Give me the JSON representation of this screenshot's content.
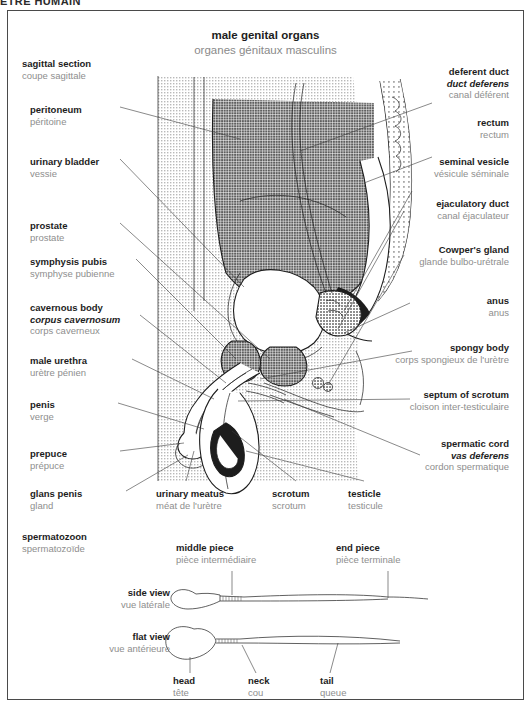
{
  "page_header": "ÊTRE HUMAIN",
  "plate": {
    "title_en": "male genital organs",
    "title_fr": "organes génitaux masculins"
  },
  "sections": [
    {
      "name": "sagittal-section",
      "en": "sagittal section",
      "fr": "coupe sagittale"
    },
    {
      "name": "spermatozoon",
      "en": "spermatozoon",
      "fr": "spermatozoïde"
    }
  ],
  "labels_left": [
    {
      "en": "peritoneum",
      "fr": "péritoine"
    },
    {
      "en": "urinary bladder",
      "fr": "vessie"
    },
    {
      "en": "prostate",
      "fr": "prostate"
    },
    {
      "en": "symphysis pubis",
      "fr": "symphyse pubienne"
    },
    {
      "en": "cavernous body",
      "la": "corpus cavernosum",
      "fr": "corps caverneux"
    },
    {
      "en": "male urethra",
      "fr": "urètre pénien"
    },
    {
      "en": "penis",
      "fr": "verge"
    },
    {
      "en": "prepuce",
      "fr": "prépuce"
    },
    {
      "en": "glans penis",
      "fr": "gland"
    }
  ],
  "labels_right": [
    {
      "en": "deferent duct",
      "la": "duct deferens",
      "fr": "canal déférent"
    },
    {
      "en": "rectum",
      "fr": "rectum"
    },
    {
      "en": "seminal vesicle",
      "fr": "vésicule séminale"
    },
    {
      "en": "ejaculatory duct",
      "fr": "canal éjaculateur"
    },
    {
      "en": "Cowper's gland",
      "fr": "glande bulbo-urétrale"
    },
    {
      "en": "anus",
      "fr": "anus"
    },
    {
      "en": "spongy body",
      "fr": "corps spongieux de l'urètre"
    },
    {
      "en": "septum of scrotum",
      "fr": "cloison inter-testiculaire"
    },
    {
      "en": "spermatic cord",
      "la": "vas deferens",
      "fr": "cordon spermatique"
    }
  ],
  "labels_bottom": [
    {
      "en": "urinary meatus",
      "fr": "méat de l'urètre"
    },
    {
      "en": "scrotum",
      "fr": "scrotum"
    },
    {
      "en": "testicle",
      "fr": "testicule"
    }
  ],
  "sperm": {
    "views": [
      {
        "en": "side view",
        "fr": "vue latérale"
      },
      {
        "en": "flat view",
        "fr": "vue antérieure"
      }
    ],
    "parts_top": [
      {
        "en": "middle piece",
        "fr": "pièce intermédiaire"
      },
      {
        "en": "end piece",
        "fr": "pièce terminale"
      }
    ],
    "parts_bottom": [
      {
        "en": "head",
        "fr": "tête"
      },
      {
        "en": "neck",
        "fr": "cou"
      },
      {
        "en": "tail",
        "fr": "queue"
      }
    ]
  },
  "colors": {
    "text_primary": "#1d1d1d",
    "text_secondary": "#8e8e8e",
    "frame": "#4a4a4a",
    "leader": "#3a3a3a",
    "background": "#ffffff"
  }
}
